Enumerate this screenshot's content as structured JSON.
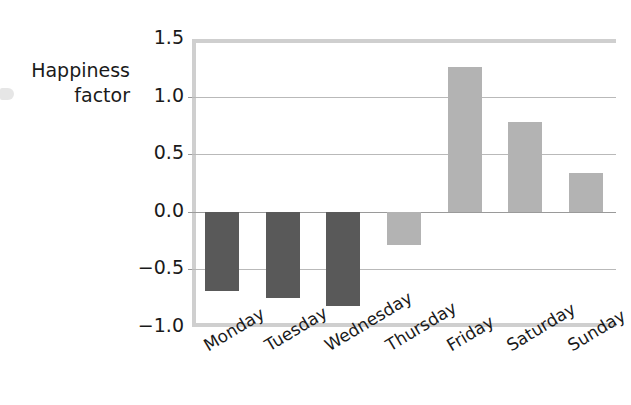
{
  "chart_data": {
    "type": "bar",
    "title": "",
    "xlabel": "",
    "ylabel": "Happiness factor",
    "ylabel_line1": "Happiness",
    "ylabel_line2": "factor",
    "categories": [
      "Monday",
      "Tuesday",
      "Wednesday",
      "Thursday",
      "Friday",
      "Saturday",
      "Sunday"
    ],
    "values": [
      -0.69,
      -0.75,
      -0.82,
      -0.29,
      1.26,
      0.78,
      0.34
    ],
    "bar_colors": [
      "#595959",
      "#595959",
      "#595959",
      "#b3b3b3",
      "#b3b3b3",
      "#b3b3b3",
      "#b3b3b3"
    ],
    "ylim": [
      -1.0,
      1.5
    ],
    "yticks": [
      1.5,
      1.0,
      0.5,
      0.0,
      -0.5,
      -1.0
    ],
    "ytick_labels": [
      "1.5",
      "1.0",
      "0.5",
      "0.0",
      "−0.5",
      "−1.0"
    ],
    "grid": true,
    "grid_axis": "y",
    "legend": "none",
    "xtick_rotation": -31,
    "zero_reference": 0.0
  },
  "colors": {
    "negative_bar": "#595959",
    "positive_bar": "#b3b3b3",
    "gridline": "#b9b9b9",
    "frame": "#cfcfcf",
    "text": "#1a1a1a",
    "background": "#ffffff"
  }
}
